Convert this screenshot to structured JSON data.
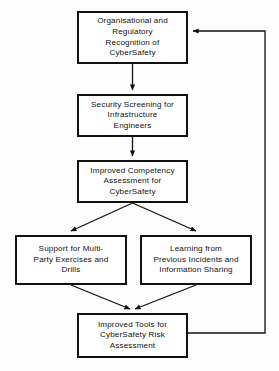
{
  "diagram": {
    "stroke_color": "#111111",
    "fill_color": "#ffffff",
    "background_color": "#fdfdfd",
    "nodes": [
      {
        "id": "regulatory-recognition",
        "label": "Organisational and\nRegulatory\nRecognition of\nCyberSafety"
      },
      {
        "id": "security-screening",
        "label": "Security Screening for\nInfrastructure\nEngineers"
      },
      {
        "id": "competency-assessment",
        "label": "Improved Competency\nAssessment for\nCyberSafety"
      },
      {
        "id": "multi-party-exercises",
        "label": "Support for Multi-\nParty Exercises and\nDrills"
      },
      {
        "id": "learning-incidents",
        "label": "Learning from\nPrevious Incidents and\nInformation Sharing"
      },
      {
        "id": "improved-tools",
        "label": "Improved Tools for\nCyberSafety Risk\nAssessment"
      }
    ],
    "edges": [
      {
        "id": "edge-recognition-to-screening",
        "from": "regulatory-recognition",
        "to": "security-screening",
        "style": "straight-down"
      },
      {
        "id": "edge-screening-to-competency",
        "from": "security-screening",
        "to": "competency-assessment",
        "style": "straight-down"
      },
      {
        "id": "edge-competency-to-exercises",
        "from": "competency-assessment",
        "to": "multi-party-exercises",
        "style": "diagonal-left"
      },
      {
        "id": "edge-competency-to-learning",
        "from": "competency-assessment",
        "to": "learning-incidents",
        "style": "diagonal-right"
      },
      {
        "id": "edge-exercises-to-tools",
        "from": "multi-party-exercises",
        "to": "improved-tools",
        "style": "diagonal-right"
      },
      {
        "id": "edge-learning-to-tools",
        "from": "learning-incidents",
        "to": "improved-tools",
        "style": "diagonal-left"
      },
      {
        "id": "edge-tools-to-recognition",
        "from": "improved-tools",
        "to": "regulatory-recognition",
        "style": "feedback-loop-right"
      }
    ]
  }
}
